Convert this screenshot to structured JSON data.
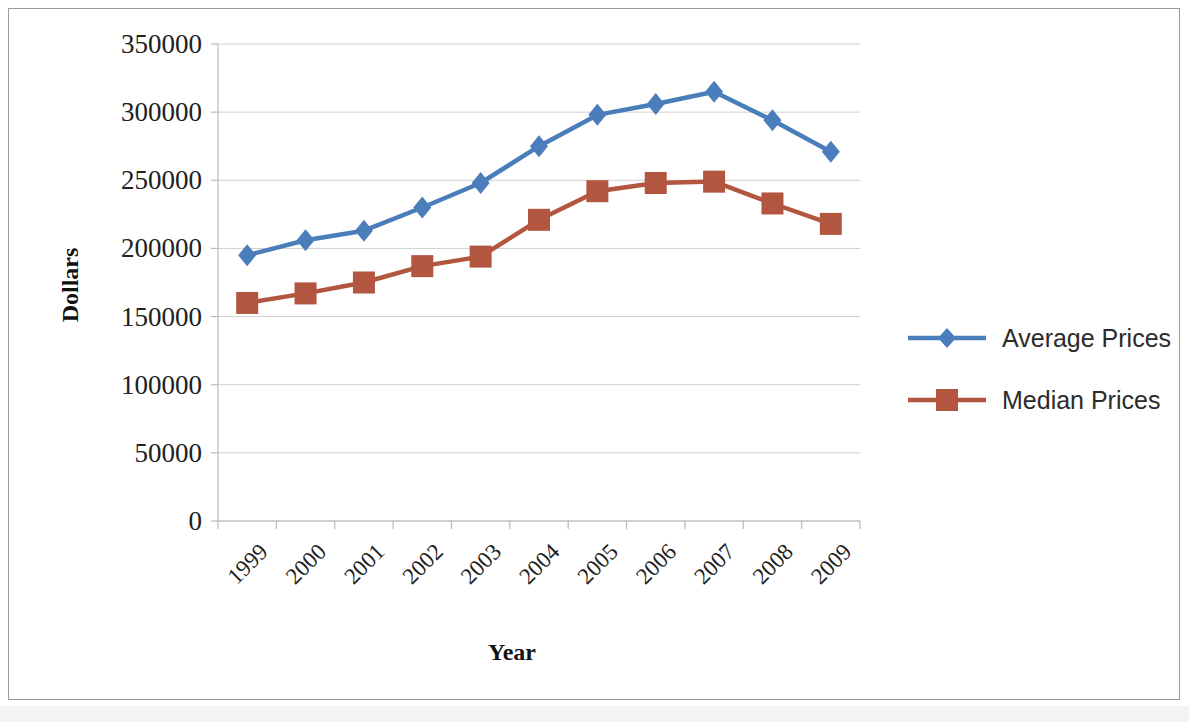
{
  "chart_data": {
    "type": "line",
    "title": "",
    "xlabel": "Year",
    "ylabel": "Dollars",
    "categories": [
      "1999",
      "2000",
      "2001",
      "2002",
      "2003",
      "2004",
      "2005",
      "2006",
      "2007",
      "2008",
      "2009"
    ],
    "series": [
      {
        "name": "Average Prices",
        "color": "#4a7ebb",
        "marker": "diamond",
        "values": [
          195000,
          206000,
          213000,
          230000,
          248000,
          275000,
          298000,
          306000,
          315000,
          294000,
          271000
        ]
      },
      {
        "name": "Median Prices",
        "color": "#b2563f",
        "marker": "square",
        "values": [
          160000,
          167000,
          175000,
          187000,
          194000,
          221000,
          242000,
          248000,
          249000,
          233000,
          218000
        ]
      }
    ],
    "ylim": [
      0,
      350000
    ],
    "yticks": [
      0,
      50000,
      100000,
      150000,
      200000,
      250000,
      300000,
      350000
    ],
    "ytick_labels": [
      "0",
      "50000",
      "100000",
      "150000",
      "200000",
      "250000",
      "300000",
      "350000"
    ],
    "grid": true,
    "legend_position": "right"
  },
  "axes": {
    "y_title": "Dollars",
    "x_title": "Year"
  },
  "legend": {
    "entries": [
      {
        "label": "Average Prices",
        "color": "#4a7ebb",
        "marker": "diamond-marker"
      },
      {
        "label": "Median Prices",
        "color": "#b2563f",
        "marker": "square-marker"
      }
    ]
  }
}
